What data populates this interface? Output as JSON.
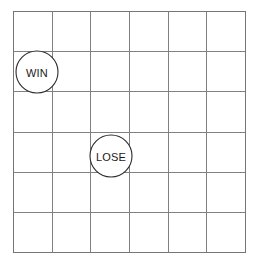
{
  "board": {
    "name": "grid-board",
    "columns": 6,
    "rows": 6,
    "origin_x": 13,
    "origin_y": 11,
    "width": 232,
    "height": 241,
    "cell_width": 38.67,
    "cell_height": 40.17,
    "line_color": "#808080",
    "border_color": "#767676",
    "background_color": "#ffffff"
  },
  "markers": [
    {
      "id": "win",
      "label": "WIN",
      "column": 1,
      "row": 2,
      "cx": 37,
      "cy": 72,
      "radius": 21,
      "fill": "#ffffff",
      "stroke": "#2b2b2b",
      "text_color": "#1a1a1a",
      "font_size": 11
    },
    {
      "id": "lose",
      "label": "LOSE",
      "column": 3,
      "row": 4,
      "cx": 111,
      "cy": 156,
      "radius": 21,
      "fill": "#ffffff",
      "stroke": "#2b2b2b",
      "text_color": "#1a1a1a",
      "font_size": 11
    }
  ]
}
